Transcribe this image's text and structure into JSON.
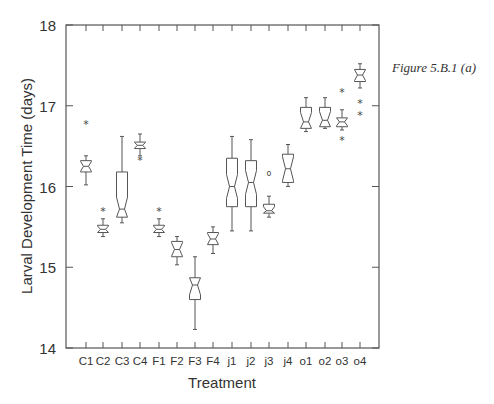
{
  "caption": "Figure 5.B.1 (a)",
  "chart_data": {
    "type": "box",
    "title": "",
    "xlabel": "Treatment",
    "ylabel": "Larval Development Time (days)",
    "ylim": [
      14,
      18
    ],
    "yticks": [
      14,
      15,
      16,
      17,
      18
    ],
    "grid": false,
    "legend": null,
    "notched": true,
    "categories": [
      "C1",
      "C2",
      "C3",
      "C4",
      "F1",
      "F2",
      "F3",
      "F4",
      "j1",
      "j2",
      "j3",
      "j4",
      "o1",
      "o2",
      "o3",
      "o4"
    ],
    "boxes": [
      {
        "name": "C1",
        "whisker_low": 16.02,
        "q1": 16.18,
        "median": 16.25,
        "q3": 16.32,
        "whisker_high": 16.38,
        "outliers": [
          {
            "v": 16.78,
            "sym": "*"
          }
        ]
      },
      {
        "name": "C2",
        "whisker_low": 15.38,
        "q1": 15.43,
        "median": 15.47,
        "q3": 15.52,
        "whisker_high": 15.6,
        "outliers": [
          {
            "v": 15.7,
            "sym": "*"
          }
        ]
      },
      {
        "name": "C3",
        "whisker_low": 15.55,
        "q1": 15.62,
        "median": 15.72,
        "q3": 16.18,
        "whisker_high": 16.62,
        "outliers": []
      },
      {
        "name": "C4",
        "whisker_low": 16.38,
        "q1": 16.47,
        "median": 16.51,
        "q3": 16.55,
        "whisker_high": 16.65,
        "outliers": [
          {
            "v": 16.33,
            "sym": "*"
          }
        ]
      },
      {
        "name": "F1",
        "whisker_low": 15.38,
        "q1": 15.43,
        "median": 15.47,
        "q3": 15.52,
        "whisker_high": 15.6,
        "outliers": [
          {
            "v": 15.7,
            "sym": "*"
          }
        ]
      },
      {
        "name": "F2",
        "whisker_low": 15.03,
        "q1": 15.13,
        "median": 15.22,
        "q3": 15.32,
        "whisker_high": 15.38,
        "outliers": []
      },
      {
        "name": "F3",
        "whisker_low": 14.23,
        "q1": 14.6,
        "median": 14.78,
        "q3": 14.87,
        "whisker_high": 15.13,
        "outliers": []
      },
      {
        "name": "F4",
        "whisker_low": 15.17,
        "q1": 15.28,
        "median": 15.35,
        "q3": 15.43,
        "whisker_high": 15.5,
        "outliers": []
      },
      {
        "name": "j1",
        "whisker_low": 15.45,
        "q1": 15.75,
        "median": 16.0,
        "q3": 16.35,
        "whisker_high": 16.62,
        "outliers": []
      },
      {
        "name": "j2",
        "whisker_low": 15.45,
        "q1": 15.75,
        "median": 16.05,
        "q3": 16.32,
        "whisker_high": 16.58,
        "outliers": []
      },
      {
        "name": "j3",
        "whisker_low": 15.62,
        "q1": 15.67,
        "median": 15.7,
        "q3": 15.78,
        "whisker_high": 15.88,
        "outliers": [
          {
            "v": 16.18,
            "sym": "o"
          }
        ]
      },
      {
        "name": "j4",
        "whisker_low": 16.0,
        "q1": 16.05,
        "median": 16.22,
        "q3": 16.4,
        "whisker_high": 16.52,
        "outliers": []
      },
      {
        "name": "o1",
        "whisker_low": 16.68,
        "q1": 16.72,
        "median": 16.8,
        "q3": 16.98,
        "whisker_high": 17.1,
        "outliers": []
      },
      {
        "name": "o2",
        "whisker_low": 16.72,
        "q1": 16.74,
        "median": 16.82,
        "q3": 16.98,
        "whisker_high": 17.1,
        "outliers": []
      },
      {
        "name": "o3",
        "whisker_low": 16.7,
        "q1": 16.74,
        "median": 16.8,
        "q3": 16.85,
        "whisker_high": 16.95,
        "outliers": [
          {
            "v": 17.17,
            "sym": "*"
          },
          {
            "v": 16.58,
            "sym": "*"
          }
        ]
      },
      {
        "name": "o4",
        "whisker_low": 17.22,
        "q1": 17.3,
        "median": 17.38,
        "q3": 17.45,
        "whisker_high": 17.52,
        "outliers": [
          {
            "v": 17.03,
            "sym": "*"
          },
          {
            "v": 16.88,
            "sym": "*"
          }
        ]
      }
    ]
  }
}
